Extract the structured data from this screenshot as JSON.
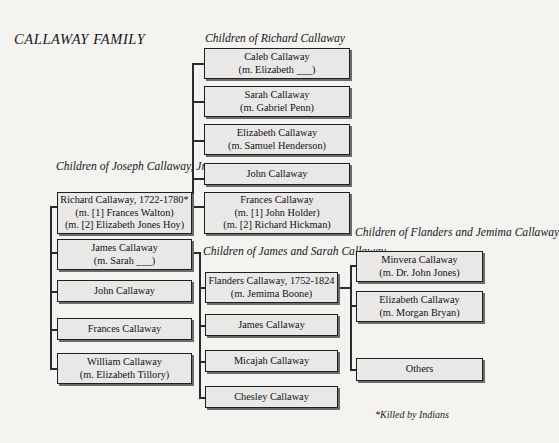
{
  "title": "CALLAWAY FAMILY",
  "footnote": "*Killed by Indians",
  "groups": {
    "joseph": {
      "line1": "Children of",
      "line2": "Joseph Callaway, Jr."
    },
    "richard": {
      "line1": "Children of Richard Callaway",
      "line2": ""
    },
    "james": {
      "line1": "Children of James",
      "line2": "and Sarah Callaway"
    },
    "flanders": {
      "line1": "Children of Flanders",
      "line2": "and Jemima Callaway"
    }
  },
  "nodes": {
    "joseph_children": [
      {
        "line1": "Richard Callaway, 1722-1780*",
        "line2": "(m. [1] Frances Walton)",
        "line3": "(m. [2] Elizabeth Jones Hoy)"
      },
      {
        "line1": "James Callaway",
        "line2": "(m. Sarah ___)",
        "line3": ""
      },
      {
        "line1": "John Callaway",
        "line2": "",
        "line3": ""
      },
      {
        "line1": "Frances Callaway",
        "line2": "",
        "line3": ""
      },
      {
        "line1": "William Callaway",
        "line2": "(m. Elizabeth Tillory)",
        "line3": ""
      }
    ],
    "richard_children": [
      {
        "line1": "Caleb Callaway",
        "line2": "(m. Elizabeth ___)",
        "line3": ""
      },
      {
        "line1": "Sarah Callaway",
        "line2": "(m. Gabriel Penn)",
        "line3": ""
      },
      {
        "line1": "Elizabeth Callaway",
        "line2": "(m. Samuel Henderson)",
        "line3": ""
      },
      {
        "line1": "John Callaway",
        "line2": "",
        "line3": ""
      },
      {
        "line1": "Frances Callaway",
        "line2": "(m. [1] John Holder)",
        "line3": "(m. [2] Richard Hickman)"
      }
    ],
    "james_children": [
      {
        "line1": "Flanders Callaway, 1752-1824",
        "line2": "(m. Jemima Boone)",
        "line3": ""
      },
      {
        "line1": "James Callaway",
        "line2": "",
        "line3": ""
      },
      {
        "line1": "Micajah Callaway",
        "line2": "",
        "line3": ""
      },
      {
        "line1": "Chesley Callaway",
        "line2": "",
        "line3": ""
      }
    ],
    "flanders_children": [
      {
        "line1": "Minvera Callaway",
        "line2": "(m. Dr. John Jones)",
        "line3": ""
      },
      {
        "line1": "Elizabeth Callaway",
        "line2": "(m. Morgan Bryan)",
        "line3": ""
      },
      {
        "line1": "Others",
        "line2": "",
        "line3": ""
      }
    ]
  },
  "colors": {
    "page_background": "#f4f3f0",
    "box_fill": "#e9e8e6",
    "box_border": "#1d1e22",
    "connector": "#2a2b2f",
    "text": "#111216"
  }
}
